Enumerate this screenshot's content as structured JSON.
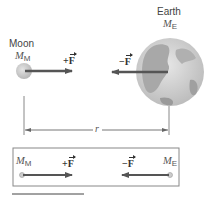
{
  "diagram": {
    "moon": {
      "name": "Moon",
      "symbol": "M",
      "subscript": "M"
    },
    "earth": {
      "name": "Earth",
      "symbol": "M",
      "subscript": "E"
    },
    "force_on_moon": {
      "sign": "+",
      "label": "F"
    },
    "force_on_earth": {
      "sign": "−",
      "label": "F"
    },
    "distance_label": "r",
    "free_body": {
      "left_symbol": "M",
      "left_subscript": "M",
      "right_symbol": "M",
      "right_subscript": "E",
      "left_force_sign": "+",
      "left_force_label": "F",
      "right_force_sign": "−",
      "right_force_label": "F"
    },
    "colors": {
      "arrow": "#555555",
      "moon": "#c8c8c8",
      "earth_land": "#a9a9a9",
      "earth_ocean": "#d6d6d6",
      "box_border": "#888888"
    }
  }
}
